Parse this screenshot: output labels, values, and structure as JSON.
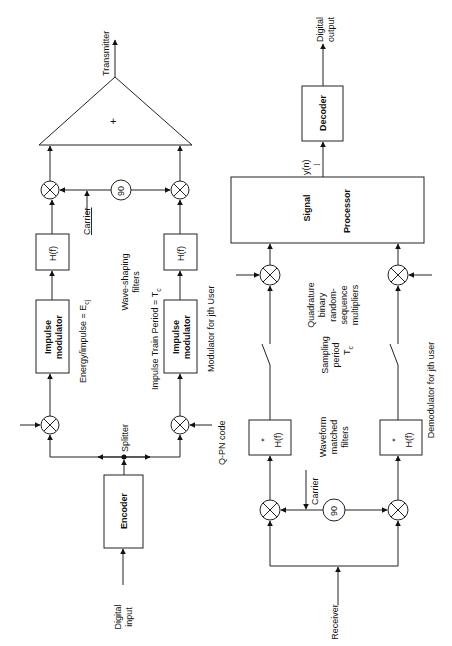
{
  "transmitter": {
    "output_label": "Transmitter",
    "summer_symbol": "+",
    "phase_shifter": "90",
    "carrier_label": "Carrier",
    "filter_label": "H(f)",
    "wave_shaping_label_1": "Wave-shaping",
    "wave_shaping_label_2": "filters",
    "impulse_modulator_1": "Impulse",
    "impulse_modulator_2": "modulator",
    "energy_label": "Energy/impulse = E",
    "energy_sub": "cj",
    "impulse_period_label": "Impulse Train Period = T",
    "impulse_period_sub": "c",
    "modulator_caption": "Modulator for jth User",
    "splitter_label": "Splitter",
    "qpn_label": "Q-PN code",
    "encoder_label": "Encoder",
    "input_label_1": "Digital",
    "input_label_2": "input"
  },
  "receiver": {
    "output_label_1": "Digital",
    "output_label_2": "output",
    "decoder_label": "Decoder",
    "processor_label_1": "Signal",
    "processor_label_2": "Processor",
    "yn_label": "y(n)",
    "yn_sub": "j",
    "quadrature_1": "Quadrature",
    "quadrature_2": "binary",
    "quadrature_3": "random-",
    "quadrature_4": "sequence",
    "quadrature_5": "multipliers",
    "sampling_1": "Sampling",
    "sampling_2": "period",
    "sampling_3": "T",
    "sampling_sub": "c",
    "matched_filter_label": "H(f)",
    "matched_filter_star": "*",
    "waveform_1": "Waveform",
    "waveform_2": "matched",
    "waveform_3": "filters",
    "phase_shifter": "90",
    "carrier_label": "Carrier",
    "receiver_label": "Receiver",
    "demodulator_caption": "Demodulator for jth user"
  }
}
